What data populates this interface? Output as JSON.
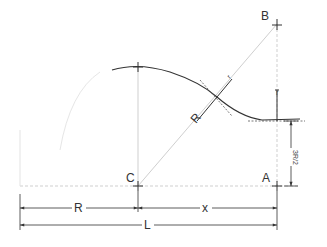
{
  "diagram": {
    "colors": {
      "line": "#333333",
      "construction": "#c8c8c8",
      "background": "#ffffff"
    },
    "points": {
      "B": "B",
      "C": "C",
      "A": "A"
    },
    "labels": {
      "radius_large": "R",
      "radius_small": "r",
      "radius_small_vertical": "r",
      "height": "3R/2",
      "dim_R": "R",
      "dim_x": "x",
      "dim_L": "L"
    }
  }
}
